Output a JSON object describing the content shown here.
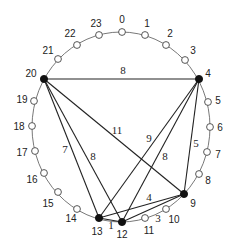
{
  "diagram": {
    "type": "circular-graph",
    "ring": {
      "cx": 121,
      "cy": 127,
      "rx": 89,
      "ry": 95
    },
    "colors": {
      "ring": "#555555",
      "edge": "#222222",
      "filled_node": "#111111",
      "empty_node": "#ffffff"
    },
    "nodes": [
      {
        "id": "0",
        "x": 122,
        "y": 32,
        "filled": false,
        "lx": 122,
        "ly": 19
      },
      {
        "id": "1",
        "x": 145,
        "y": 35,
        "filled": false,
        "lx": 147,
        "ly": 23
      },
      {
        "id": "2",
        "x": 166,
        "y": 45,
        "filled": false,
        "lx": 170,
        "ly": 33
      },
      {
        "id": "3",
        "x": 185,
        "y": 60,
        "filled": false,
        "lx": 193,
        "ly": 50
      },
      {
        "id": "4",
        "x": 199,
        "y": 79,
        "filled": true,
        "lx": 208,
        "ly": 73
      },
      {
        "id": "5",
        "x": 208,
        "y": 102,
        "filled": false,
        "lx": 218,
        "ly": 100
      },
      {
        "id": "6",
        "x": 210,
        "y": 127,
        "filled": false,
        "lx": 220,
        "ly": 127
      },
      {
        "id": "7",
        "x": 207,
        "y": 152,
        "filled": false,
        "lx": 218,
        "ly": 154
      },
      {
        "id": "8",
        "x": 199,
        "y": 174,
        "filled": false,
        "lx": 208,
        "ly": 180
      },
      {
        "id": "9",
        "x": 184,
        "y": 194,
        "filled": true,
        "lx": 193,
        "ly": 203
      },
      {
        "id": "10",
        "x": 166,
        "y": 209,
        "filled": false,
        "lx": 174,
        "ly": 219
      },
      {
        "id": "11",
        "x": 145,
        "y": 218,
        "filled": false,
        "lx": 149,
        "ly": 230
      },
      {
        "id": "12",
        "x": 122,
        "y": 222,
        "filled": true,
        "lx": 122,
        "ly": 234
      },
      {
        "id": "13",
        "x": 99,
        "y": 218,
        "filled": true,
        "lx": 97,
        "ly": 231
      },
      {
        "id": "14",
        "x": 77,
        "y": 209,
        "filled": false,
        "lx": 71,
        "ly": 218
      },
      {
        "id": "15",
        "x": 58,
        "y": 192,
        "filled": false,
        "lx": 48,
        "ly": 203
      },
      {
        "id": "16",
        "x": 44,
        "y": 173,
        "filled": false,
        "lx": 32,
        "ly": 179
      },
      {
        "id": "17",
        "x": 35,
        "y": 151,
        "filled": false,
        "lx": 22,
        "ly": 152
      },
      {
        "id": "18",
        "x": 32,
        "y": 126,
        "filled": false,
        "lx": 19,
        "ly": 126
      },
      {
        "id": "19",
        "x": 34,
        "y": 101,
        "filled": false,
        "lx": 22,
        "ly": 99
      },
      {
        "id": "20",
        "x": 44,
        "y": 79,
        "filled": true,
        "lx": 31,
        "ly": 73
      },
      {
        "id": "21",
        "x": 58,
        "y": 59,
        "filled": false,
        "lx": 48,
        "ly": 50
      },
      {
        "id": "22",
        "x": 77,
        "y": 45,
        "filled": false,
        "lx": 70,
        "ly": 33
      },
      {
        "id": "23",
        "x": 99,
        "y": 35,
        "filled": false,
        "lx": 96,
        "ly": 23
      }
    ],
    "edges": [
      {
        "from": "20",
        "to": "4",
        "weight": "8",
        "lx": 123,
        "ly": 70
      },
      {
        "from": "20",
        "to": "9",
        "weight": "11",
        "lx": 117,
        "ly": 130
      },
      {
        "from": "20",
        "to": "13",
        "weight": "7",
        "lx": 65,
        "ly": 149
      },
      {
        "from": "20",
        "to": "12",
        "weight": "8",
        "lx": 93,
        "ly": 156
      },
      {
        "from": "4",
        "to": "13",
        "weight": "9",
        "lx": 149,
        "ly": 138
      },
      {
        "from": "4",
        "to": "12",
        "weight": "8",
        "lx": 165,
        "ly": 156
      },
      {
        "from": "4",
        "to": "9",
        "weight": "5",
        "lx": 196,
        "ly": 143
      },
      {
        "from": "13",
        "to": "9",
        "weight": "4",
        "lx": 149,
        "ly": 197
      },
      {
        "from": "12",
        "to": "9",
        "weight": "3",
        "lx": 158,
        "ly": 218
      },
      {
        "from": "13",
        "to": "12",
        "weight": "1",
        "lx": 111,
        "ly": 225
      }
    ]
  }
}
